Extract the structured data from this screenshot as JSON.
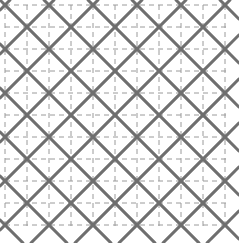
{
  "figure": {
    "name": "sashiko-diamond-lattice-pattern",
    "width": 239,
    "height": 243,
    "background_color": "#ffffff"
  },
  "grid": {
    "label": "dashed construction grid",
    "color": "#9a9a9a",
    "stroke_width": 1,
    "dash_pattern": "5,4",
    "cell_size": 22,
    "origin_x": 5,
    "origin_y": 5,
    "left": 5,
    "top": 5,
    "right": 227,
    "bottom": 227,
    "columns": 11,
    "rows": 11,
    "x_lines": [
      5,
      27,
      49,
      71,
      93,
      115,
      137,
      159,
      181,
      203,
      225,
      227
    ],
    "y_lines": [
      5,
      27,
      49,
      71,
      93,
      115,
      137,
      159,
      181,
      203,
      225,
      227
    ]
  },
  "lattice": {
    "label": "stitched diamond lattice",
    "color": "#6f6f6f",
    "stroke_width": 2.6,
    "line_cap": "round",
    "line_join": "round",
    "diamond_half_diagonal": 22,
    "diamond_pitch_x": 44,
    "diamond_pitch_y": 44,
    "row_offset_x": 22,
    "orientation_degrees": 45,
    "centers_row_spacing": 22,
    "first_center_x": 27,
    "first_center_y": 5,
    "rows": 11,
    "cols": 7,
    "description": "Interlocking diamonds rotated 45 degrees, every other row offset by half a pitch, producing X crossings at grid intersections."
  },
  "chart_data": {
    "type": "scatter",
    "xlabel": "",
    "ylabel": "",
    "xlim": [
      0,
      239
    ],
    "ylim": [
      0,
      243
    ],
    "grid": true,
    "legend": "none",
    "series": [
      {
        "name": "dashed construction grid",
        "color": "#9a9a9a",
        "spacing": 22,
        "x": [
          5,
          27,
          49,
          71,
          93,
          115,
          137,
          159,
          181,
          203,
          225
        ],
        "y": [
          5,
          27,
          49,
          71,
          93,
          115,
          137,
          159,
          181,
          203,
          225
        ]
      },
      {
        "name": "diamond centers",
        "color": "#6f6f6f",
        "half_diagonal": 22,
        "pitch": 44,
        "stagger": 22
      }
    ]
  }
}
